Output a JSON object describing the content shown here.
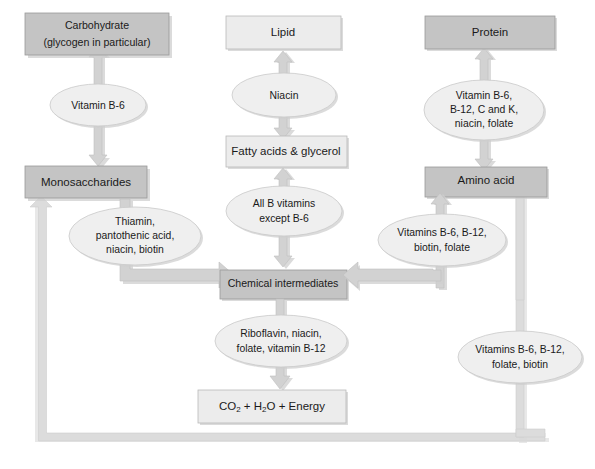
{
  "diagram": {
    "colors": {
      "box_dark": "#c4c4c4",
      "box_light": "#ececec",
      "ellipse": "#efefef",
      "arrow": "#d2d2d2",
      "text": "#1a1a1a",
      "background": "#ffffff"
    },
    "boxes": {
      "carbohydrate": {
        "line1": "Carbohydrate",
        "line2": "(glycogen in particular)",
        "shade": "dark"
      },
      "lipid": {
        "line1": "Lipid",
        "shade": "light"
      },
      "protein": {
        "line1": "Protein",
        "shade": "dark"
      },
      "monosaccharides": {
        "line1": "Monosaccharides",
        "shade": "dark"
      },
      "fatty_acids": {
        "line1": "Fatty acids & glycerol",
        "shade": "light"
      },
      "amino_acid": {
        "line1": "Amino acid",
        "shade": "dark"
      },
      "chemical_intermediates": {
        "line1": "Chemical intermediates",
        "shade": "dark"
      },
      "energy_products": {
        "part1": "CO",
        "sub1": "2",
        "part2": " + H",
        "sub2": "2",
        "part3": "O + Energy",
        "shade": "light"
      }
    },
    "ellipses": {
      "vitamin_b6": {
        "lines": [
          "Vitamin B-6"
        ]
      },
      "niacin": {
        "lines": [
          "Niacin"
        ]
      },
      "protein_vitamins": {
        "lines": [
          "Vitamin B-6,",
          "B-12, C and K,",
          "niacin, folate"
        ]
      },
      "thiamin_group": {
        "lines": [
          "Thiamin,",
          "pantothenic acid,",
          "niacin, biotin"
        ]
      },
      "all_b_vitamins": {
        "lines": [
          "All B vitamins",
          "except B-6"
        ]
      },
      "amino_vitamins": {
        "lines": [
          "Vitamins B-6, B-12,",
          "biotin, folate"
        ]
      },
      "riboflavin_group": {
        "lines": [
          "Riboflavin, niacin,",
          "folate, vitamin B-12"
        ]
      },
      "return_vitamins": {
        "lines": [
          "Vitamins B-6, B-12,",
          "folate, biotin"
        ]
      }
    }
  }
}
